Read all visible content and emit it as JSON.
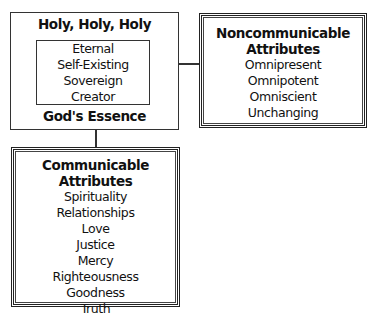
{
  "essence_box": {
    "title": "Holy, Holy, Holy",
    "inner_items": [
      "Eternal",
      "Self-Existing",
      "Sovereign",
      "Creator"
    ],
    "footer": "God's Essence"
  },
  "noncommunicable_box": {
    "title_line1": "Noncommunicable",
    "title_line2": "Attributes",
    "items": [
      "Omnipresent",
      "Omnipotent",
      "Omniscient",
      "Unchanging"
    ]
  },
  "communicable_box": {
    "title": "Communicable Attributes",
    "items": [
      "Spirituality",
      "Relationships",
      "Love",
      "Justice",
      "Mercy",
      "Righteousness",
      "Goodness",
      "Truth"
    ]
  }
}
